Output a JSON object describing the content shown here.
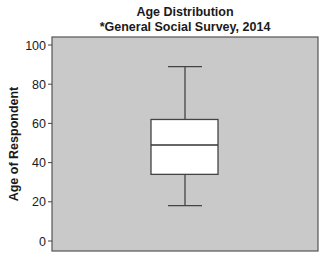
{
  "chart_data": {
    "type": "boxplot",
    "title": "Age Distribution",
    "subtitle": "*General Social Survey, 2014",
    "xlabel": "",
    "ylabel": "Age of Respondent",
    "ylim": [
      -2,
      103
    ],
    "yticks": [
      0,
      20,
      40,
      60,
      80,
      100
    ],
    "grid": false,
    "legend": null,
    "series": [
      {
        "name": "Age of Respondent",
        "min": 18,
        "q1": 34,
        "median": 49,
        "q3": 62,
        "max": 89
      }
    ],
    "colors": {
      "plot_background": "#c9c9c9",
      "box_fill": "#ffffff",
      "lines": "#444444"
    }
  }
}
